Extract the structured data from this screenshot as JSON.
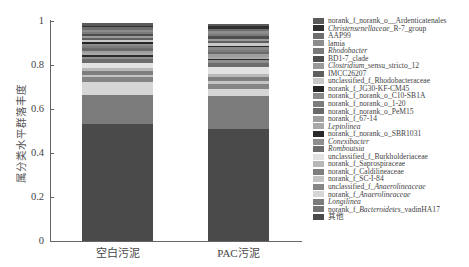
{
  "chart_data": {
    "type": "bar",
    "stacked": true,
    "title": "",
    "xlabel": "",
    "ylabel": "属分类水平群落丰度",
    "ylim": [
      0,
      1
    ],
    "yticks": [
      "0",
      "0.2",
      "0.4",
      "0.6",
      "0.8",
      "1"
    ],
    "categories": [
      "空白污泥",
      "PAC污泥"
    ],
    "legend_position": "right",
    "grid": false,
    "series": [
      {
        "name": "norank_f_norank_o__Ardenticatenales",
        "color": "#5a5a5a",
        "values": [
          0.01,
          0.012
        ]
      },
      {
        "name": "Christensenellaceae_R-7_group",
        "color": "#2f2f2f",
        "values": [
          0.008,
          0.01
        ]
      },
      {
        "name": "AAP99",
        "color": "#6e6e6e",
        "values": [
          0.01,
          0.012
        ]
      },
      {
        "name": "lamia",
        "color": "#8c8c8c",
        "values": [
          0.01,
          0.012
        ]
      },
      {
        "name": "Rhodobacter",
        "color": "#7a7a7a",
        "values": [
          0.01,
          0.012
        ]
      },
      {
        "name": "BD1-7_clade",
        "color": "#4e4e4e",
        "values": [
          0.008,
          0.01
        ]
      },
      {
        "name": "Clostridium_sensu_stricto_12",
        "color": "#9a9a9a",
        "values": [
          0.01,
          0.012
        ]
      },
      {
        "name": "IMCC26207",
        "color": "#5f5f5f",
        "values": [
          0.01,
          0.01
        ]
      },
      {
        "name": "unclassified_f_Rhodobacteraceae",
        "color": "#c8c8c8",
        "values": [
          0.01,
          0.01
        ]
      },
      {
        "name": "norank_f_JG30-KF-CM45",
        "color": "#262626",
        "values": [
          0.008,
          0.008
        ]
      },
      {
        "name": "norank_f_norank_o_C10-SB1A",
        "color": "#8a8a8a",
        "values": [
          0.01,
          0.012
        ]
      },
      {
        "name": "norank_f_norank_o_1-20",
        "color": "#7c7c7c",
        "values": [
          0.01,
          0.01
        ]
      },
      {
        "name": "norank_f_norank_o_PeM15",
        "color": "#6a6a6a",
        "values": [
          0.01,
          0.01
        ]
      },
      {
        "name": "norank_f_67-14",
        "color": "#9e9e9e",
        "values": [
          0.01,
          0.01
        ]
      },
      {
        "name": "Leptolinea",
        "color": "#a8a8a8",
        "values": [
          0.01,
          0.01
        ]
      },
      {
        "name": "norank_f_norank_o_SBR1031",
        "color": "#2a2a2a",
        "values": [
          0.01,
          0.008
        ]
      },
      {
        "name": "Conexibacter",
        "color": "#8e8e8e",
        "values": [
          0.01,
          0.01
        ]
      },
      {
        "name": "Romboutsia",
        "color": "#6c6c6c",
        "values": [
          0.015,
          0.02
        ]
      },
      {
        "name": "unclassified_f_Burkholderiaceae",
        "color": "#e2e2e2",
        "values": [
          0.025,
          0.03
        ]
      },
      {
        "name": "norank_f_Saprospiraceae",
        "color": "#b8b8b8",
        "values": [
          0.015,
          0.015
        ]
      },
      {
        "name": "norank_f_Caldilineaceae",
        "color": "#7e7e7e",
        "values": [
          0.015,
          0.02
        ]
      },
      {
        "name": "norank_f_SC-I-84",
        "color": "#c4c4c4",
        "values": [
          0.01,
          0.01
        ]
      },
      {
        "name": "unclassified_f_Anaerolineaceae",
        "color": "#858585",
        "values": [
          0.025,
          0.025
        ]
      },
      {
        "name": "norank_f_Anaerolineaceae",
        "color": "#d6d6d6",
        "values": [
          0.055,
          0.03
        ]
      },
      {
        "name": "Longilinea",
        "color": "#7b7b7b",
        "values": [
          0.135,
          0.15
        ]
      },
      {
        "name": "norank_f_Bacteroidetes_vadinHA17",
        "color": "#737373",
        "values": [
          0.0,
          0.0
        ]
      },
      {
        "name": "其他",
        "color": "#4a4a4a",
        "values": [
          0.531,
          0.511
        ]
      }
    ]
  },
  "legend": [
    {
      "label": "norank_f_norank_o__Ardenticatenales",
      "parts": [
        {
          "t": "norank_f_norank_o__Ardenticatenales",
          "i": false
        }
      ]
    },
    {
      "label": "Christensenellaceae_R-7_group",
      "parts": [
        {
          "t": "Christensenellaceae",
          "i": true
        },
        {
          "t": "_R-7_group",
          "i": false
        }
      ]
    },
    {
      "label": "AAP99",
      "parts": [
        {
          "t": "AAP99",
          "i": false
        }
      ]
    },
    {
      "label": "lamia",
      "parts": [
        {
          "t": "lamia",
          "i": false
        }
      ]
    },
    {
      "label": "Rhodobacter",
      "parts": [
        {
          "t": "Rhodobacter",
          "i": true
        }
      ]
    },
    {
      "label": "BD1-7_clade",
      "parts": [
        {
          "t": "BD1-7_clade",
          "i": false
        }
      ]
    },
    {
      "label": "Clostridium_sensu_stricto_12",
      "parts": [
        {
          "t": "Clostridium",
          "i": true
        },
        {
          "t": "_sensu_stricto_12",
          "i": false
        }
      ]
    },
    {
      "label": "IMCC26207",
      "parts": [
        {
          "t": "IMCC26207",
          "i": false
        }
      ]
    },
    {
      "label": "unclassified_f_Rhodobacteraceae",
      "parts": [
        {
          "t": "unclassified_f_Rhodobacteraceae",
          "i": false
        }
      ]
    },
    {
      "label": "norank_f_JG30-KF-CM45",
      "parts": [
        {
          "t": "norank_f_JG30-KF-CM45",
          "i": false
        }
      ]
    },
    {
      "label": "norank_f_norank_o_C10-SB1A",
      "parts": [
        {
          "t": "norank_f_norank_o_C10-SB1A",
          "i": false
        }
      ]
    },
    {
      "label": "norank_f_norank_o_1-20",
      "parts": [
        {
          "t": "norank_f_norank_o_1-20",
          "i": false
        }
      ]
    },
    {
      "label": "norank_f_norank_o_PeM15",
      "parts": [
        {
          "t": "norank_f_norank_o_PeM15",
          "i": false
        }
      ]
    },
    {
      "label": "norank_f_67-14",
      "parts": [
        {
          "t": "norank_f_67-14",
          "i": false
        }
      ]
    },
    {
      "label": "Leptolinea",
      "parts": [
        {
          "t": "Leptolinea",
          "i": true
        }
      ]
    },
    {
      "label": "norank_f_norank_o_SBR1031",
      "parts": [
        {
          "t": "norank_f_norank_o_SBR1031",
          "i": false
        }
      ]
    },
    {
      "label": "Conexibacter",
      "parts": [
        {
          "t": "Conexibacter",
          "i": true
        }
      ]
    },
    {
      "label": "Romboutsia",
      "parts": [
        {
          "t": "Romboutsia",
          "i": true
        }
      ]
    },
    {
      "label": "unclassified_f_Burkholderiaceae",
      "parts": [
        {
          "t": "unclassified_f_Burkholderiaceae",
          "i": false
        }
      ]
    },
    {
      "label": "norank_f_Saprospiraceae",
      "parts": [
        {
          "t": "norank_f_Saprospiraceae",
          "i": false
        }
      ]
    },
    {
      "label": "norank_f_Caldilineaceae",
      "parts": [
        {
          "t": "norank_f_Caldilineaceae",
          "i": false
        }
      ]
    },
    {
      "label": "norank_f_SC-I-84",
      "parts": [
        {
          "t": "norank_f_SC-I-84",
          "i": false
        }
      ]
    },
    {
      "label": "unclassified_f_Anaerolineaceae",
      "parts": [
        {
          "t": "unclassified_f_",
          "i": false
        },
        {
          "t": "Anaerolineaceae",
          "i": true
        }
      ]
    },
    {
      "label": "norank_f_Anaerolineaceae",
      "parts": [
        {
          "t": "norank_f_",
          "i": false
        },
        {
          "t": "Anaerolineaceae",
          "i": true
        }
      ]
    },
    {
      "label": "Longilinea",
      "parts": [
        {
          "t": "Longilinea",
          "i": true
        }
      ]
    },
    {
      "label": "norank_f_Bacteroidetes_vadinHA17",
      "parts": [
        {
          "t": "norank_f_",
          "i": false
        },
        {
          "t": "Bacteroidetes",
          "i": true
        },
        {
          "t": "_vadinHA17",
          "i": false
        }
      ]
    },
    {
      "label": "其他",
      "parts": [
        {
          "t": "其他",
          "i": false
        }
      ]
    }
  ]
}
